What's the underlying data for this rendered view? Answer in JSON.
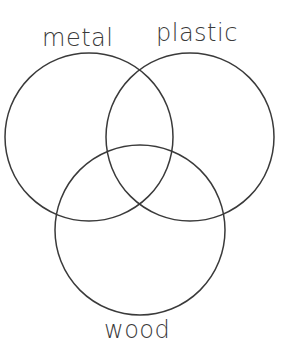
{
  "diagram": {
    "type": "venn",
    "sets": [
      {
        "id": "metal",
        "label": "metal",
        "cx": 89,
        "cy": 137,
        "r": 84
      },
      {
        "id": "plastic",
        "label": "plastic",
        "cx": 190,
        "cy": 137,
        "r": 84
      },
      {
        "id": "wood",
        "label": "wood",
        "cx": 140,
        "cy": 230,
        "r": 85
      }
    ],
    "stroke_color": "#3a3a3a",
    "background": "#ffffff"
  }
}
